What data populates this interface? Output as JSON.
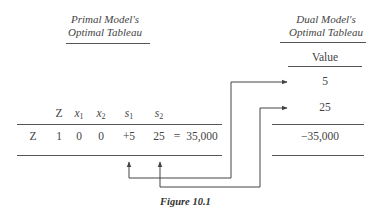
{
  "primal": {
    "title_line1": "Primal Model's",
    "title_line2": "Optimal Tableau",
    "columns": [
      {
        "name": "Z"
      },
      {
        "name": "x",
        "sub": "1"
      },
      {
        "name": "x",
        "sub": "2"
      },
      {
        "name": "s",
        "sub": "1"
      },
      {
        "name": "s",
        "sub": "2"
      }
    ],
    "row": {
      "label": "Z",
      "values": [
        "1",
        "0",
        "0",
        "+5",
        "25"
      ],
      "equals": "=",
      "rhs": "35,000"
    }
  },
  "dual": {
    "title_line1": "Dual Model's",
    "title_line2": "Optimal Tableau",
    "column_header": "Value",
    "values": [
      "5",
      "25"
    ],
    "objective": "−35,000"
  },
  "caption": "Figure 10.1",
  "colors": {
    "ink": "#444444",
    "rule": "#555555"
  }
}
